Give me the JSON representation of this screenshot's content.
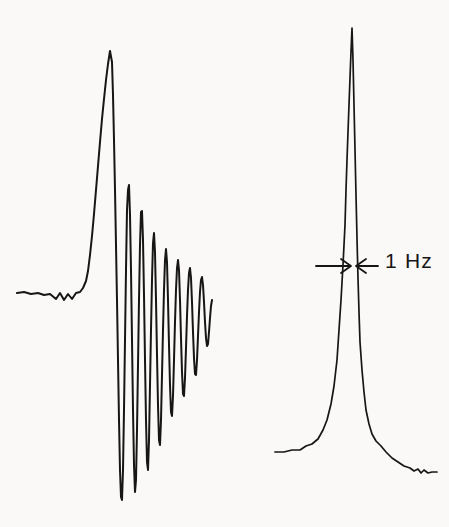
{
  "figure": {
    "type": "nmr-spectra-comparison",
    "background_color": "#faf9f7",
    "trace_color": "#161616",
    "width": 449,
    "height": 527
  },
  "annotation": {
    "linewidth_label": "1 Hz",
    "arrow_left_name": "left-inward-arrow",
    "arrow_right_name": "right-inward-arrow"
  },
  "chart_data": {
    "type": "line",
    "title": "",
    "xlabel": "",
    "ylabel": "",
    "grid": false,
    "legend": null,
    "annotations": [
      {
        "text": "1 Hz",
        "kind": "linewidth-marker",
        "target": "right-peak",
        "x_px": 385,
        "y_px": 250,
        "arrow_left_tip_x_px": 350,
        "arrow_right_tip_x_px": 357,
        "arrow_y_px": 266
      }
    ],
    "series": [
      {
        "name": "left-spectrum-with-ringing",
        "description": "Rapid-scan CW NMR resonance showing strong transient ringing (wiggle-beats) after the main line; poor field homogeneity / fast sweep.",
        "baseline_y_px": 293,
        "apex_x_px": 110,
        "apex_y_px": 51,
        "lowest_y_px": 500,
        "x_range_px": [
          17,
          212
        ],
        "points": [
          [
            17,
            293
          ],
          [
            24,
            292
          ],
          [
            31,
            294
          ],
          [
            38,
            293
          ],
          [
            44,
            295
          ],
          [
            50,
            294
          ],
          [
            56,
            299
          ],
          [
            60,
            293
          ],
          [
            64,
            300
          ],
          [
            68,
            294
          ],
          [
            72,
            299
          ],
          [
            76,
            293
          ],
          [
            80,
            292
          ],
          [
            83,
            288
          ],
          [
            86,
            281
          ],
          [
            88,
            271
          ],
          [
            90,
            255
          ],
          [
            92,
            236
          ],
          [
            94,
            214
          ],
          [
            96,
            190
          ],
          [
            98,
            166
          ],
          [
            100,
            142
          ],
          [
            102,
            119
          ],
          [
            104,
            99
          ],
          [
            106,
            80
          ],
          [
            108,
            64
          ],
          [
            110,
            51
          ],
          [
            112,
            62
          ],
          [
            113,
            95
          ],
          [
            114,
            140
          ],
          [
            115,
            190
          ],
          [
            116,
            245
          ],
          [
            117,
            300
          ],
          [
            118,
            360
          ],
          [
            119,
            420
          ],
          [
            120,
            470
          ],
          [
            121,
            497
          ],
          [
            122,
            500
          ],
          [
            123,
            470
          ],
          [
            124,
            410
          ],
          [
            125,
            340
          ],
          [
            126,
            270
          ],
          [
            127,
            210
          ],
          [
            128,
            190
          ],
          [
            129,
            185
          ],
          [
            130,
            215
          ],
          [
            131,
            270
          ],
          [
            132,
            340
          ],
          [
            133,
            410
          ],
          [
            134,
            465
          ],
          [
            135,
            492
          ],
          [
            136,
            480
          ],
          [
            137,
            430
          ],
          [
            138,
            365
          ],
          [
            139,
            300
          ],
          [
            140,
            245
          ],
          [
            141,
            212
          ],
          [
            142,
            211
          ],
          [
            143,
            240
          ],
          [
            144,
            295
          ],
          [
            145,
            360
          ],
          [
            146,
            420
          ],
          [
            147,
            462
          ],
          [
            148,
            470
          ],
          [
            149,
            440
          ],
          [
            150,
            385
          ],
          [
            151,
            330
          ],
          [
            152,
            280
          ],
          [
            153,
            243
          ],
          [
            154,
            233
          ],
          [
            155,
            252
          ],
          [
            156,
            300
          ],
          [
            157,
            355
          ],
          [
            158,
            405
          ],
          [
            159,
            440
          ],
          [
            160,
            445
          ],
          [
            161,
            420
          ],
          [
            162,
            375
          ],
          [
            163,
            330
          ],
          [
            164,
            290
          ],
          [
            165,
            260
          ],
          [
            166,
            249
          ],
          [
            167,
            262
          ],
          [
            168,
            300
          ],
          [
            169,
            345
          ],
          [
            170,
            385
          ],
          [
            171,
            412
          ],
          [
            172,
            416
          ],
          [
            173,
            396
          ],
          [
            174,
            360
          ],
          [
            175,
            322
          ],
          [
            176,
            290
          ],
          [
            177,
            268
          ],
          [
            178,
            260
          ],
          [
            179,
            270
          ],
          [
            180,
            300
          ],
          [
            181,
            338
          ],
          [
            182,
            372
          ],
          [
            183,
            394
          ],
          [
            184,
            396
          ],
          [
            185,
            378
          ],
          [
            186,
            348
          ],
          [
            187,
            316
          ],
          [
            188,
            290
          ],
          [
            189,
            273
          ],
          [
            190,
            268
          ],
          [
            191,
            278
          ],
          [
            192,
            302
          ],
          [
            193,
            332
          ],
          [
            194,
            358
          ],
          [
            195,
            374
          ],
          [
            196,
            375
          ],
          [
            197,
            360
          ],
          [
            198,
            336
          ],
          [
            199,
            312
          ],
          [
            200,
            292
          ],
          [
            201,
            280
          ],
          [
            202,
            277
          ],
          [
            203,
            285
          ],
          [
            204,
            302
          ],
          [
            205,
            322
          ],
          [
            206,
            338
          ],
          [
            207,
            346
          ],
          [
            208,
            344
          ],
          [
            209,
            332
          ],
          [
            210,
            318
          ],
          [
            211,
            306
          ],
          [
            212,
            300
          ]
        ]
      },
      {
        "name": "right-spectrum-sharp-line",
        "description": "Well-shimmed NMR resonance: single narrow Lorentzian line with linewidth of 1 Hz at half height, no ringing.",
        "baseline_y_px": 455,
        "apex_x_px": 352,
        "apex_y_px": 28,
        "linewidth_hz": 1,
        "x_range_px": [
          275,
          437
        ],
        "points": [
          [
            275,
            452
          ],
          [
            284,
            452
          ],
          [
            292,
            450
          ],
          [
            300,
            450
          ],
          [
            306,
            446
          ],
          [
            312,
            444
          ],
          [
            318,
            439
          ],
          [
            323,
            430
          ],
          [
            327,
            420
          ],
          [
            331,
            404
          ],
          [
            334,
            386
          ],
          [
            337,
            360
          ],
          [
            339,
            330
          ],
          [
            341,
            300
          ],
          [
            343,
            265
          ],
          [
            345,
            225
          ],
          [
            346,
            190
          ],
          [
            347,
            160
          ],
          [
            348,
            132
          ],
          [
            349,
            105
          ],
          [
            350,
            78
          ],
          [
            351,
            52
          ],
          [
            352,
            28
          ],
          [
            353,
            60
          ],
          [
            354,
            105
          ],
          [
            355,
            150
          ],
          [
            356,
            195
          ],
          [
            357,
            238
          ],
          [
            358,
            278
          ],
          [
            359,
            312
          ],
          [
            360,
            342
          ],
          [
            362,
            370
          ],
          [
            364,
            392
          ],
          [
            366,
            410
          ],
          [
            369,
            424
          ],
          [
            372,
            434
          ],
          [
            376,
            441
          ],
          [
            381,
            446
          ],
          [
            386,
            452
          ],
          [
            392,
            458
          ],
          [
            398,
            462
          ],
          [
            404,
            466
          ],
          [
            410,
            468
          ],
          [
            414,
            471
          ],
          [
            418,
            469
          ],
          [
            421,
            473
          ],
          [
            424,
            470
          ],
          [
            428,
            473
          ],
          [
            432,
            472
          ],
          [
            437,
            472
          ]
        ]
      }
    ]
  }
}
